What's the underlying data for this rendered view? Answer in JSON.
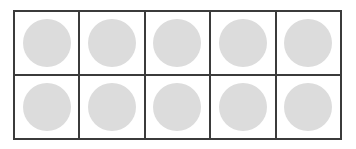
{
  "figure": {
    "name": "ten-frame",
    "background_color": "#ffffff"
  },
  "grid": {
    "columns": 5,
    "rows": 2,
    "total_cells": 10,
    "filled_cells": 10,
    "empty_cells": 0,
    "border_color": "#3b3b3b",
    "border_width_px": 2,
    "cell_background": "#ffffff"
  },
  "counter": {
    "shape": "circle",
    "fill_color": "#dcdcdc",
    "diameter_px": 48,
    "count_label": "10"
  },
  "cells": [
    {
      "id": "cell-r1-c1",
      "row": 1,
      "column": 1,
      "filled": true,
      "counter_label": "counter"
    },
    {
      "id": "cell-r1-c2",
      "row": 1,
      "column": 2,
      "filled": true,
      "counter_label": "counter"
    },
    {
      "id": "cell-r1-c3",
      "row": 1,
      "column": 3,
      "filled": true,
      "counter_label": "counter"
    },
    {
      "id": "cell-r1-c4",
      "row": 1,
      "column": 4,
      "filled": true,
      "counter_label": "counter"
    },
    {
      "id": "cell-r1-c5",
      "row": 1,
      "column": 5,
      "filled": true,
      "counter_label": "counter"
    },
    {
      "id": "cell-r2-c1",
      "row": 2,
      "column": 1,
      "filled": true,
      "counter_label": "counter"
    },
    {
      "id": "cell-r2-c2",
      "row": 2,
      "column": 2,
      "filled": true,
      "counter_label": "counter"
    },
    {
      "id": "cell-r2-c3",
      "row": 2,
      "column": 3,
      "filled": true,
      "counter_label": "counter"
    },
    {
      "id": "cell-r2-c4",
      "row": 2,
      "column": 4,
      "filled": true,
      "counter_label": "counter"
    },
    {
      "id": "cell-r2-c5",
      "row": 2,
      "column": 5,
      "filled": true,
      "counter_label": "counter"
    }
  ],
  "chart_data": {
    "type": "table",
    "categories": [
      "r1c1",
      "r1c2",
      "r1c3",
      "r1c4",
      "r1c5",
      "r2c1",
      "r2c2",
      "r2c3",
      "r2c4",
      "r2c5"
    ],
    "values": [
      1,
      1,
      1,
      1,
      1,
      1,
      1,
      1,
      1,
      1
    ],
    "xlabel": "",
    "ylabel": "",
    "legend": [],
    "grid": true
  }
}
